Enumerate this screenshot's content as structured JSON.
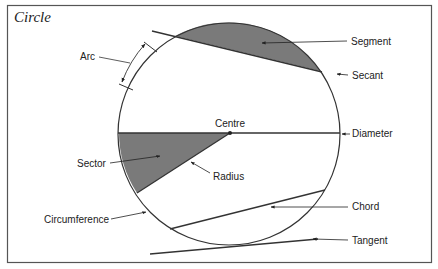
{
  "title": "Circle",
  "colors": {
    "stroke": "#333333",
    "fill_shaded": "#7a7a7a",
    "frame": "#555555",
    "background": "#ffffff"
  },
  "labels": {
    "arc": "Arc",
    "segment": "Segment",
    "secant": "Secant",
    "centre": "Centre",
    "diameter": "Diameter",
    "sector": "Sector",
    "radius": "Radius",
    "circumference": "Circumference",
    "chord": "Chord",
    "tangent": "Tangent"
  }
}
